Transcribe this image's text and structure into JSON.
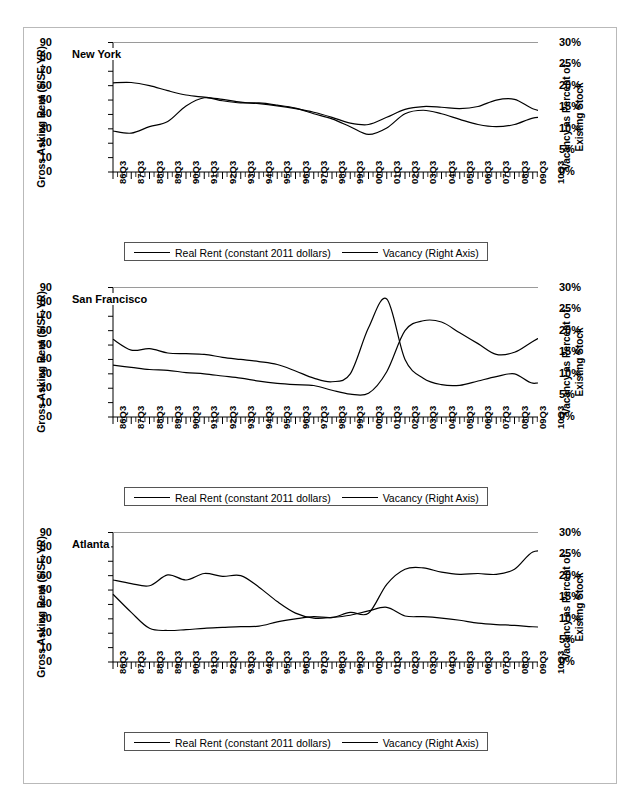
{
  "figure": {
    "axis_left_title": "Gross Asking Rent ($/SF-YR)",
    "axis_right_title_line1": "Vacancy as Percent of",
    "axis_right_title_line2": "Existing Stock",
    "legend": {
      "series1": "Real Rent (constant 2011 dollars)",
      "series2": "Vacancy (Right Axis)"
    },
    "y_left_ticks": [
      "90",
      "80",
      "70",
      "60",
      "50",
      "40",
      "30",
      "20",
      "10",
      "0"
    ],
    "y_right_ticks": [
      "30%",
      "25%",
      "20%",
      "15%",
      "10%",
      "5%",
      "0%"
    ],
    "x_ticks": [
      "86Q3",
      "87Q3",
      "88Q3",
      "89Q3",
      "90Q3",
      "91Q3",
      "92Q3",
      "93Q3",
      "94Q3",
      "95Q3",
      "96Q3",
      "97Q3",
      "98Q3",
      "99Q3",
      "00Q3",
      "01Q3",
      "02Q3",
      "03Q3",
      "04Q3",
      "05Q3",
      "06Q3",
      "07Q3",
      "08Q3",
      "09Q3",
      "10Q3"
    ],
    "line_color": "#000000"
  },
  "chart_data": [
    {
      "type": "line",
      "title": "New York",
      "xlabel": "",
      "ylabel": "Gross Asking Rent ($/SF-YR)",
      "ylabel_right": "Vacancy as Percent of Existing Stock",
      "ylim": [
        0,
        90
      ],
      "ylim_right": [
        0,
        30
      ],
      "grid": false,
      "legend_position": "bottom",
      "x": [
        "86Q3",
        "87Q3",
        "88Q3",
        "89Q3",
        "90Q3",
        "91Q3",
        "92Q3",
        "93Q3",
        "94Q3",
        "95Q3",
        "96Q3",
        "97Q3",
        "98Q3",
        "99Q3",
        "00Q3",
        "01Q3",
        "02Q3",
        "03Q3",
        "04Q3",
        "05Q3",
        "06Q3",
        "07Q3",
        "08Q3",
        "09Q3",
        "10Q3"
      ],
      "series": [
        {
          "name": "Real Rent (constant 2011 dollars)",
          "axis": "left",
          "unit": "$/SF-YR",
          "values": [
            62.0,
            62.2,
            60.0,
            56.5,
            53.5,
            52.0,
            50.5,
            48.5,
            47.5,
            46.0,
            44.0,
            41.5,
            38.0,
            34.0,
            33.0,
            38.0,
            43.5,
            45.5,
            45.0,
            44.0,
            45.5,
            50.0,
            50.5,
            44.0,
            41.0
          ]
        },
        {
          "name": "Vacancy (Right Axis)",
          "axis": "right",
          "unit": "percent",
          "values": [
            9.5,
            9.0,
            10.5,
            11.7,
            15.3,
            17.2,
            16.5,
            16.0,
            16.0,
            15.5,
            14.8,
            13.5,
            12.3,
            10.5,
            8.7,
            10.2,
            13.5,
            14.3,
            13.5,
            12.2,
            11.0,
            10.5,
            11.0,
            12.5,
            12.8
          ]
        }
      ]
    },
    {
      "type": "line",
      "title": "San Francisco",
      "xlabel": "",
      "ylabel": "Gross Asking Rent ($/SF-YR)",
      "ylabel_right": "Vacancy as Percent of Existing Stock",
      "ylim": [
        0,
        90
      ],
      "ylim_right": [
        0,
        30
      ],
      "grid": false,
      "legend_position": "bottom",
      "x": [
        "86Q3",
        "87Q3",
        "88Q3",
        "89Q3",
        "90Q3",
        "91Q3",
        "92Q3",
        "93Q3",
        "94Q3",
        "95Q3",
        "96Q3",
        "97Q3",
        "98Q3",
        "99Q3",
        "00Q3",
        "01Q3",
        "02Q3",
        "03Q3",
        "04Q3",
        "05Q3",
        "06Q3",
        "07Q3",
        "08Q3",
        "09Q3",
        "10Q3"
      ],
      "series": [
        {
          "name": "Real Rent (constant 2011 dollars)",
          "axis": "left",
          "unit": "$/SF-YR",
          "values": [
            54.0,
            46.5,
            47.5,
            44.5,
            44.0,
            43.5,
            41.5,
            40.0,
            38.5,
            36.5,
            32.0,
            27.0,
            24.5,
            30.0,
            62.0,
            82.0,
            40.0,
            27.0,
            22.5,
            22.0,
            25.0,
            28.0,
            30.0,
            23.5,
            26.5
          ]
        },
        {
          "name": "Vacancy (Right Axis)",
          "axis": "right",
          "unit": "percent",
          "values": [
            12.0,
            11.5,
            11.0,
            10.8,
            10.3,
            10.0,
            9.5,
            9.0,
            8.3,
            7.8,
            7.5,
            7.3,
            6.2,
            5.3,
            5.5,
            10.5,
            20.0,
            22.3,
            22.0,
            19.5,
            17.0,
            14.5,
            15.0,
            17.5,
            19.8
          ]
        }
      ]
    },
    {
      "type": "line",
      "title": "Atlanta",
      "xlabel": "",
      "ylabel": "Gross Asking Rent ($/SF-YR)",
      "ylabel_right": "Vacancy as Percent of Existing Stock",
      "ylim": [
        0,
        90
      ],
      "ylim_right": [
        0,
        30
      ],
      "grid": false,
      "legend_position": "bottom",
      "x": [
        "86Q3",
        "87Q3",
        "88Q3",
        "89Q3",
        "90Q3",
        "91Q3",
        "92Q3",
        "93Q3",
        "94Q3",
        "95Q3",
        "96Q3",
        "97Q3",
        "98Q3",
        "99Q3",
        "00Q3",
        "01Q3",
        "02Q3",
        "03Q3",
        "04Q3",
        "05Q3",
        "06Q3",
        "07Q3",
        "08Q3",
        "09Q3",
        "10Q3"
      ],
      "series": [
        {
          "name": "Real Rent (constant 2011 dollars)",
          "axis": "left",
          "unit": "$/SF-YR",
          "values": [
            57.0,
            54.5,
            53.0,
            60.5,
            57.0,
            61.5,
            59.5,
            60.0,
            52.0,
            42.0,
            34.0,
            30.5,
            31.0,
            32.5,
            35.5,
            38.0,
            32.0,
            31.5,
            30.5,
            29.0,
            27.0,
            26.0,
            25.5,
            24.5,
            24.0
          ]
        },
        {
          "name": "Vacancy (Right Axis)",
          "axis": "right",
          "unit": "percent",
          "values": [
            15.7,
            11.5,
            7.8,
            7.3,
            7.5,
            7.8,
            8.0,
            8.2,
            8.3,
            9.3,
            10.0,
            10.5,
            10.3,
            11.5,
            11.3,
            18.0,
            21.5,
            21.8,
            20.8,
            20.3,
            20.5,
            20.3,
            21.5,
            25.5,
            25.5
          ]
        }
      ]
    }
  ]
}
